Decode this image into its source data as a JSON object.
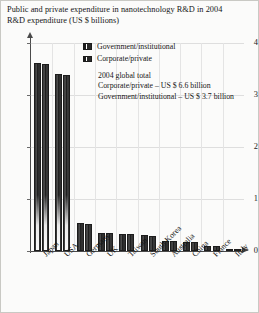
{
  "title": {
    "line1": "Public and private expenditure in nanotechnology R&D in 2004",
    "line2": "R&D expenditure (US $ billions)"
  },
  "legend": {
    "position": "inside-top-right",
    "items": [
      {
        "label": "Government/institutional",
        "swatch": "legend-swatch-government"
      },
      {
        "label": "Corporate/private",
        "swatch": "legend-swatch-corporate"
      }
    ]
  },
  "annotation": {
    "line1": "2004 global total",
    "line2": "Corporate/private – US $ 6.6 billion",
    "line3": "Government/institutional – US $ 3.7 billion"
  },
  "axis": {
    "y_ticks": [
      "0",
      "1",
      "2",
      "3",
      "4"
    ],
    "x_labels": [
      "Japan",
      "USA",
      "Germany",
      "UK",
      "Taiwan",
      "South Korea",
      "Australia",
      "China",
      "France",
      "Italy"
    ]
  },
  "chart_data": {
    "type": "bar",
    "title": "Public and private expenditure in nanotechnology R&D in 2004",
    "subtitle": "R&D expenditure (US $ billions)",
    "xlabel": "",
    "ylabel": "R&D expenditure (US $ billions)",
    "ylim": [
      0,
      4
    ],
    "yticks": [
      0,
      1,
      2,
      3,
      4
    ],
    "grid": true,
    "legend_position": "inside-top-right",
    "categories": [
      "Japan",
      "USA",
      "Germany",
      "UK",
      "Taiwan",
      "South Korea",
      "Australia",
      "China",
      "France",
      "Italy"
    ],
    "series": [
      {
        "name": "Government/institutional",
        "values": [
          3.62,
          3.4,
          0.53,
          0.35,
          0.33,
          0.3,
          0.2,
          0.18,
          0.1,
          0.04
        ]
      },
      {
        "name": "Corporate/private",
        "values": [
          3.6,
          3.38,
          0.52,
          0.34,
          0.32,
          0.29,
          0.19,
          0.17,
          0.09,
          0.03
        ]
      }
    ],
    "annotations": [
      "2004 global total",
      "Corporate/private – US $ 6.6 billion",
      "Government/institutional – US $ 3.7 billion"
    ]
  },
  "colors": {
    "bar_government": "#2c2c2c",
    "bar_corporate": "#303030",
    "axis": "#4a4a4a",
    "grid": "#dedede",
    "background": "#fbfbfa",
    "text": "#151515"
  }
}
